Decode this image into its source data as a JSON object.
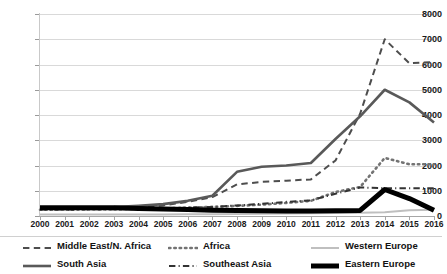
{
  "chart_data": {
    "type": "line",
    "title": "",
    "subtitle": "",
    "xlabel": "",
    "ylabel": "",
    "x": [
      2000,
      2001,
      2002,
      2003,
      2004,
      2005,
      2006,
      2007,
      2008,
      2009,
      2010,
      2011,
      2012,
      2013,
      2014,
      2015,
      2016
    ],
    "categories": [
      "2000",
      "2001",
      "2002",
      "2003",
      "2004",
      "2005",
      "2006",
      "2007",
      "2008",
      "2009",
      "2010",
      "2011",
      "2012",
      "2013",
      "2014",
      "2015",
      "2016"
    ],
    "xlim": [
      2000,
      2016
    ],
    "ylim": [
      0,
      8000
    ],
    "y_ticks": [
      0,
      1000,
      2000,
      3000,
      4000,
      5000,
      6000,
      7000,
      8000
    ],
    "y_tick_labels": [
      "0",
      "1000",
      "2000",
      "3000",
      "4000",
      "5000",
      "6000",
      "7000",
      "8000"
    ],
    "grid": "horizontal",
    "legend_position": "bottom",
    "series": [
      {
        "name": "Middle East/N. Africa",
        "style": "dashed",
        "color": "#4d4d4d",
        "width": 2,
        "values": [
          300,
          300,
          320,
          330,
          350,
          420,
          560,
          750,
          1250,
          1350,
          1400,
          1450,
          2200,
          4050,
          7000,
          6050,
          6100
        ]
      },
      {
        "name": "South Asia",
        "style": "solid",
        "color": "#595959",
        "width": 2.6,
        "values": [
          330,
          330,
          330,
          350,
          400,
          470,
          600,
          800,
          1750,
          1950,
          2000,
          2100,
          3050,
          3950,
          5000,
          4500,
          3700
        ]
      },
      {
        "name": "Africa",
        "style": "dotted",
        "color": "#737373",
        "width": 2.6,
        "values": [
          250,
          250,
          260,
          270,
          280,
          300,
          330,
          360,
          400,
          450,
          520,
          600,
          950,
          1150,
          2300,
          2050,
          2050
        ]
      },
      {
        "name": "Southeast Asia",
        "style": "dashdot",
        "color": "#333333",
        "width": 2,
        "values": [
          260,
          260,
          265,
          270,
          280,
          300,
          330,
          360,
          420,
          480,
          560,
          620,
          880,
          1130,
          1100,
          1100,
          1100
        ]
      },
      {
        "name": "Western Europe",
        "style": "solid",
        "color": "#bfbfbf",
        "width": 2,
        "values": [
          60,
          60,
          60,
          60,
          60,
          60,
          65,
          70,
          80,
          90,
          100,
          110,
          120,
          130,
          150,
          230,
          250
        ]
      },
      {
        "name": "Eastern Europe",
        "style": "solid",
        "color": "#000000",
        "width": 5,
        "values": [
          330,
          330,
          330,
          330,
          300,
          280,
          260,
          230,
          220,
          210,
          200,
          200,
          210,
          220,
          1050,
          690,
          230
        ]
      }
    ]
  },
  "legend": {
    "items": [
      {
        "label": "Middle East/N. Africa",
        "key": "middle-east-n-africa"
      },
      {
        "label": "South Asia",
        "key": "south-asia"
      },
      {
        "label": "Africa",
        "key": "africa"
      },
      {
        "label": "Southeast Asia",
        "key": "southeast-asia"
      },
      {
        "label": "Western Europe",
        "key": "western-europe"
      },
      {
        "label": "Eastern Europe",
        "key": "eastern-europe"
      }
    ]
  }
}
